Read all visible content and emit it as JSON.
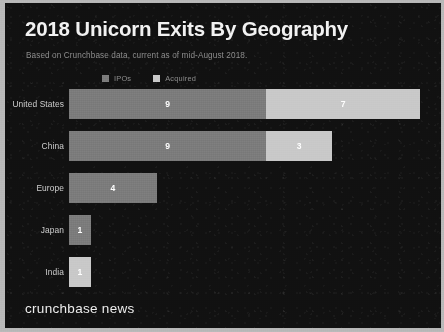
{
  "header": {
    "title": "2018 Unicorn Exits By Geography",
    "subtitle": "Based on Crunchbase data, current as of mid-August 2018."
  },
  "footer": {
    "brand": "crunchbase news"
  },
  "colors": {
    "background": "#111111",
    "frame": "#b9b9b9",
    "title_text": "#f2f2f2",
    "subtitle_text": "#8d8d8d",
    "label_text": "#cfcfcf",
    "ipos": "#7c7c7c",
    "acquired": "#c9c9c9",
    "value_text": "#ffffff"
  },
  "chart_data": {
    "type": "bar",
    "orientation": "horizontal",
    "stacked": true,
    "title": "2018 Unicorn Exits By Geography",
    "subtitle": "Based on Crunchbase data, current as of mid-August 2018.",
    "xlabel": "",
    "ylabel": "",
    "xlim": [
      0,
      16
    ],
    "grid": false,
    "legend_position": "top",
    "categories": [
      "United States",
      "China",
      "Europe",
      "Japan",
      "India"
    ],
    "series": [
      {
        "name": "IPOs",
        "color": "#7c7c7c",
        "values": [
          9,
          9,
          4,
          1,
          0
        ]
      },
      {
        "name": "Acquired",
        "color": "#c9c9c9",
        "values": [
          7,
          3,
          0,
          0,
          1
        ]
      }
    ],
    "totals": [
      16,
      12,
      4,
      1,
      1
    ],
    "rows": [
      {
        "label": "United States",
        "segments": [
          {
            "series": "IPOs",
            "value": 9,
            "label": "9",
            "show_label": true
          },
          {
            "series": "Acquired",
            "value": 7,
            "label": "7",
            "show_label": true
          }
        ]
      },
      {
        "label": "China",
        "segments": [
          {
            "series": "IPOs",
            "value": 9,
            "label": "9",
            "show_label": true
          },
          {
            "series": "Acquired",
            "value": 3,
            "label": "3",
            "show_label": true
          }
        ]
      },
      {
        "label": "Europe",
        "segments": [
          {
            "series": "IPOs",
            "value": 4,
            "label": "4",
            "show_label": true
          }
        ]
      },
      {
        "label": "Japan",
        "segments": [
          {
            "series": "IPOs",
            "value": 1,
            "label": "1",
            "show_label": true
          }
        ]
      },
      {
        "label": "India",
        "segments": [
          {
            "series": "Acquired",
            "value": 1,
            "label": "1",
            "show_label": true
          }
        ]
      }
    ]
  },
  "legend": {
    "items": [
      {
        "label": "IPOs",
        "swatch": "#7c7c7c",
        "icon": "square-swatch-icon"
      },
      {
        "label": "Acquired",
        "swatch": "#c9c9c9",
        "icon": "square-swatch-icon"
      }
    ]
  }
}
